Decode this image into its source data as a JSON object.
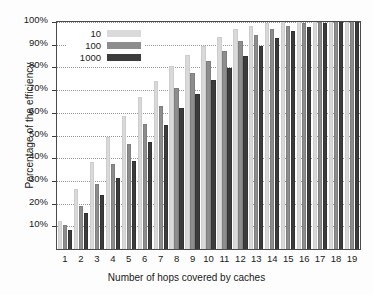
{
  "chart_data": {
    "type": "bar",
    "title": "",
    "xlabel": "Number of hops covered by caches",
    "ylabel": "Percentage of the efficiency",
    "categories": [
      "1",
      "2",
      "3",
      "4",
      "5",
      "6",
      "7",
      "8",
      "9",
      "10",
      "11",
      "12",
      "13",
      "14",
      "15",
      "16",
      "17",
      "18",
      "19"
    ],
    "series": [
      {
        "name": "10",
        "color": "#d9d9d9",
        "values": [
          12,
          26,
          38,
          49,
          58,
          66.5,
          73.5,
          80,
          85,
          89,
          93,
          96.5,
          98,
          99,
          99.5,
          100,
          100,
          100,
          100
        ]
      },
      {
        "name": "100",
        "color": "#8d8d8d",
        "values": [
          10,
          18.5,
          28,
          37,
          46,
          54.5,
          62.5,
          70.5,
          77,
          82.5,
          87,
          91,
          94,
          96.5,
          98,
          99,
          99.5,
          100,
          100
        ]
      },
      {
        "name": "1000",
        "color": "#3c3c3c",
        "values": [
          8,
          15.5,
          23.5,
          31,
          38.5,
          46.5,
          54,
          61.5,
          68,
          74,
          79.5,
          84.5,
          89,
          92.5,
          95.5,
          97.5,
          99,
          100,
          100
        ]
      }
    ],
    "ylim": [
      0,
      100
    ],
    "ytick_labels": [
      "100%",
      "90%",
      "80%",
      "70%",
      "60%",
      "50%",
      "40%",
      "30%",
      "20%",
      "10%"
    ],
    "ytick_values": [
      100,
      90,
      80,
      70,
      60,
      50,
      40,
      30,
      20,
      10
    ],
    "grid": true,
    "grid_style": "dotted-horizontal",
    "legend_position": "upper-left-inside",
    "legend_entries": [
      "10",
      "100",
      "1000"
    ]
  }
}
